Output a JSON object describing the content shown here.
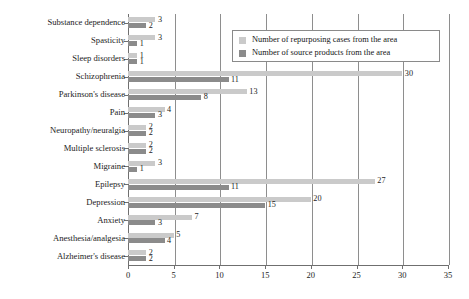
{
  "chart_data": {
    "type": "bar",
    "orientation": "horizontal",
    "title": "",
    "xlabel": "",
    "ylabel": "",
    "xlim": [
      0,
      35
    ],
    "xticks": [
      0,
      5,
      10,
      15,
      20,
      25,
      30,
      35
    ],
    "grid": true,
    "legend_position": "top-right",
    "categories": [
      "Substance dependence",
      "Spasticity",
      "Sleep disorders",
      "Schizophrenia",
      "Parkinson's disease",
      "Pain",
      "Neuropathy/neuralgia",
      "Multiple sclerosis",
      "Migraine",
      "Epilepsy",
      "Depression",
      "Anxiety",
      "Anesthesia/analgesia",
      "Alzheimer's disease"
    ],
    "series": [
      {
        "name": "Number of repurposing cases from the area",
        "color": "#cacaca",
        "values": [
          3,
          3,
          1,
          30,
          13,
          4,
          2,
          2,
          3,
          27,
          20,
          7,
          5,
          2
        ]
      },
      {
        "name": "Number of source products from the area",
        "color": "#8b8b8b",
        "values": [
          2,
          1,
          1,
          11,
          8,
          3,
          2,
          2,
          1,
          11,
          15,
          3,
          4,
          2
        ]
      }
    ]
  },
  "legend": {
    "items": [
      {
        "label": "Number of repurposing cases from the area",
        "swatch": "light"
      },
      {
        "label": "Number of source products from the area",
        "swatch": "dark"
      }
    ]
  }
}
